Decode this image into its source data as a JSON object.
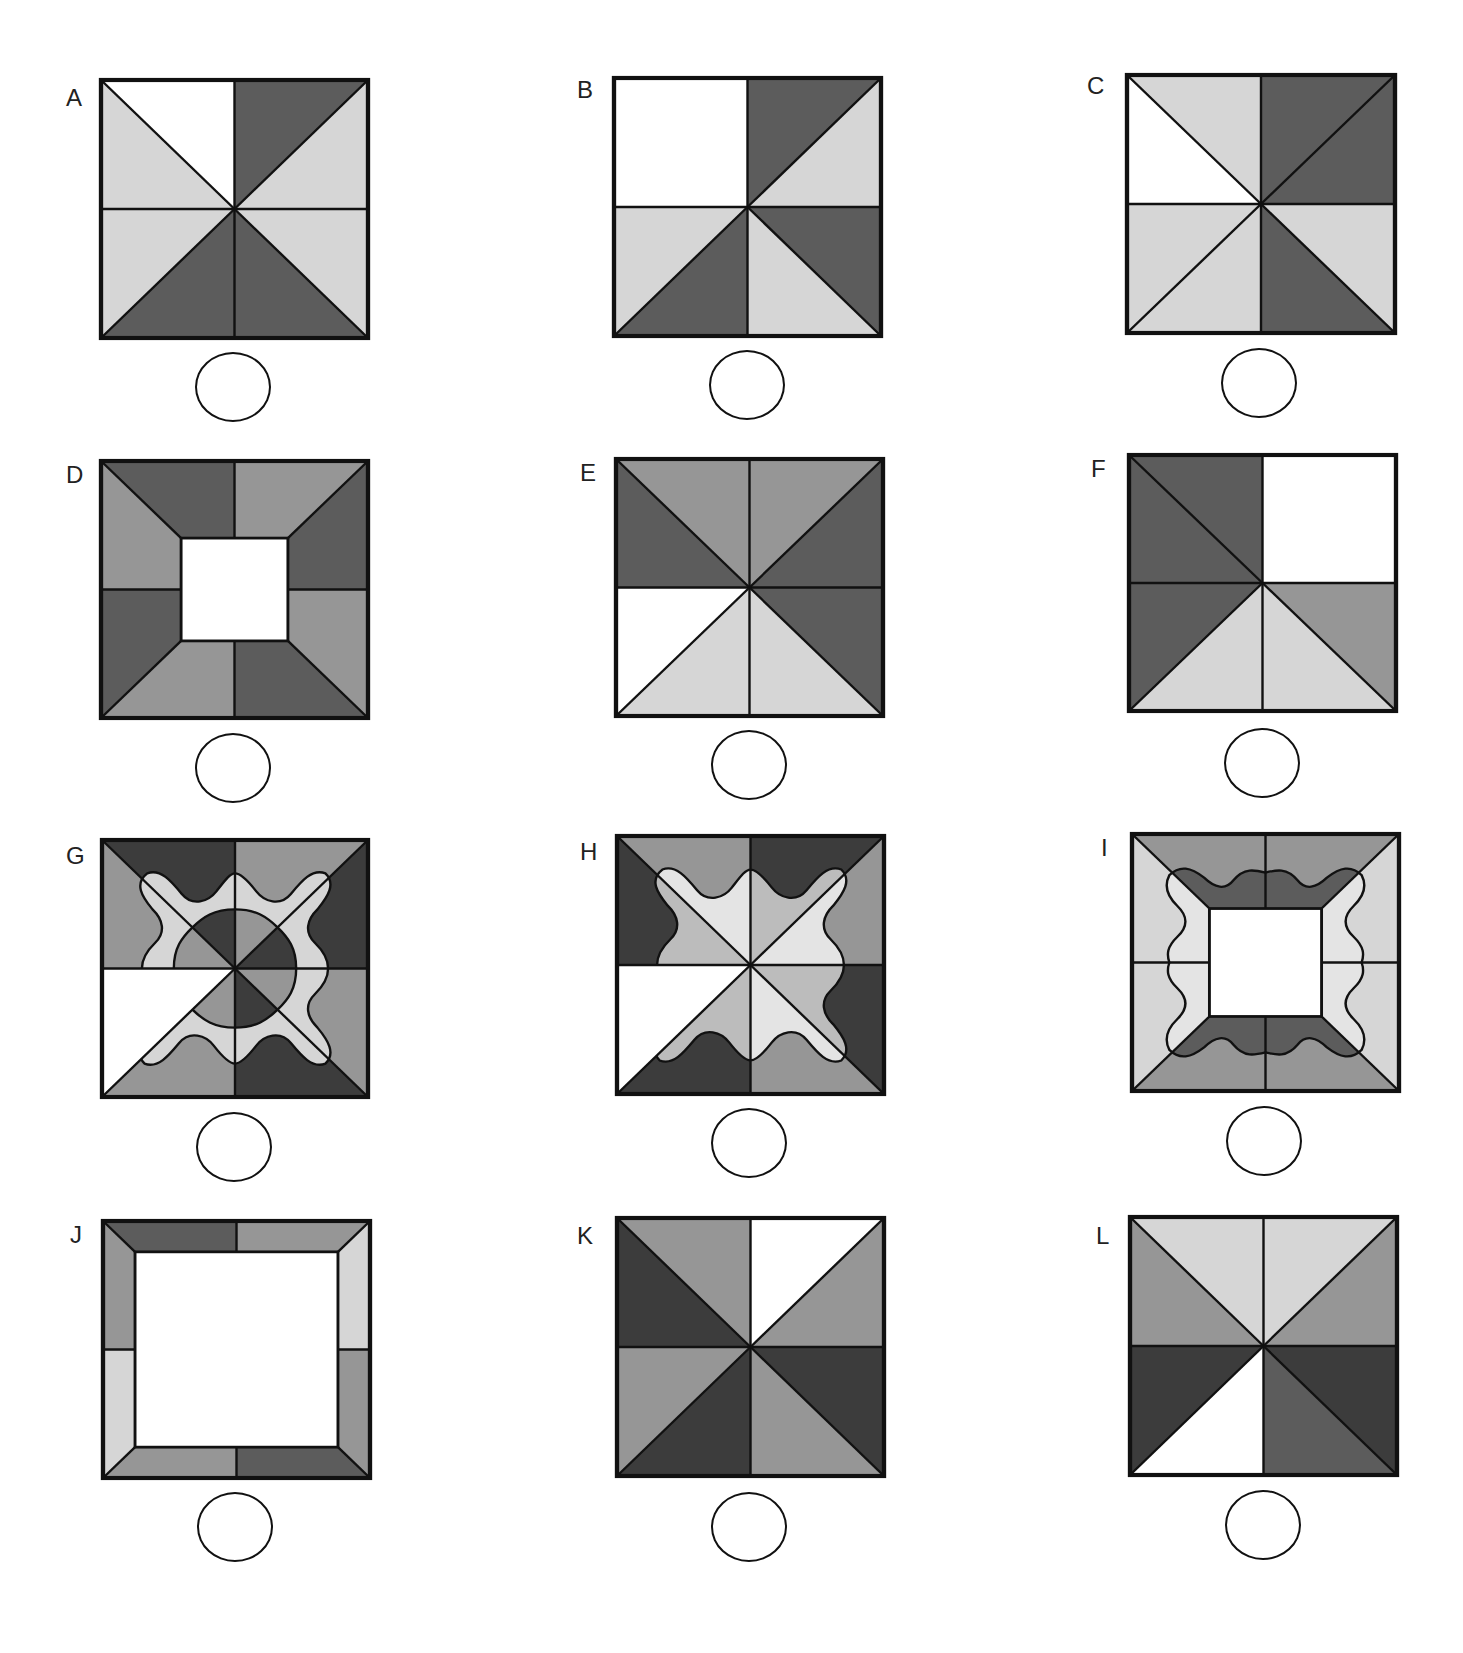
{
  "page": {
    "header_fragment": "",
    "colors": {
      "white": "#ffffff",
      "light": "#d6d6d6",
      "pale": "#e4e4e4",
      "midlight": "#bcbcbc",
      "medium": "#969696",
      "dark": "#5c5c5c",
      "darkest": "#3c3c3c",
      "stroke": "#111111"
    }
  },
  "items": [
    {
      "label": "A",
      "x": 101,
      "y": 80,
      "w": 267,
      "h": 258,
      "lx": 66,
      "ly": 84,
      "bx": 195,
      "by": 352,
      "type": "octants",
      "fill": {
        "T1": "white",
        "T2": "dark",
        "R1": "light",
        "R2": "light",
        "B2": "dark",
        "B1": "dark",
        "L2": "light",
        "L1": "light"
      }
    },
    {
      "label": "B",
      "x": 614,
      "y": 78,
      "w": 267,
      "h": 258,
      "lx": 577,
      "ly": 76,
      "bx": 709,
      "by": 350,
      "type": "octants",
      "merge": [
        "TL"
      ],
      "fill": {
        "T1": "white",
        "L1": "white",
        "T2": "dark",
        "R1": "light",
        "R2": "dark",
        "B2": "light",
        "B1": "dark",
        "L2": "light"
      }
    },
    {
      "label": "C",
      "x": 1127,
      "y": 75,
      "w": 268,
      "h": 258,
      "lx": 1087,
      "ly": 72,
      "bx": 1221,
      "by": 348,
      "type": "octants",
      "fill": {
        "T1": "light",
        "L1": "white",
        "T2": "dark",
        "R1": "dark",
        "R2": "light",
        "B2": "dark",
        "B1": "light",
        "L2": "light"
      }
    },
    {
      "label": "D",
      "x": 101,
      "y": 461,
      "w": 267,
      "h": 257,
      "lx": 66,
      "ly": 461,
      "bx": 195,
      "by": 733,
      "type": "frame",
      "inset": 30,
      "fill": {
        "T1": "dark",
        "T2": "medium",
        "R1": "dark",
        "R2": "medium",
        "B2": "dark",
        "B1": "medium",
        "L2": "dark",
        "L1": "medium"
      }
    },
    {
      "label": "E",
      "x": 616,
      "y": 459,
      "w": 267,
      "h": 257,
      "lx": 580,
      "ly": 459,
      "bx": 711,
      "by": 730,
      "type": "octants",
      "fill": {
        "T1": "medium",
        "T2": "medium",
        "R1": "dark",
        "R2": "dark",
        "B2": "light",
        "B1": "light",
        "L2": "white",
        "L1": "dark"
      }
    },
    {
      "label": "F",
      "x": 1129,
      "y": 455,
      "w": 267,
      "h": 256,
      "lx": 1091,
      "ly": 455,
      "bx": 1224,
      "by": 728,
      "type": "octants",
      "merge": [
        "TR"
      ],
      "fill": {
        "T1": "dark",
        "L1": "dark",
        "T2": "white",
        "R1": "white",
        "R2": "medium",
        "B2": "light",
        "B1": "light",
        "L2": "dark"
      }
    },
    {
      "label": "G",
      "x": 102,
      "y": 840,
      "w": 266,
      "h": 257,
      "lx": 66,
      "ly": 842,
      "bx": 196,
      "by": 1112,
      "type": "wavy",
      "fill": {
        "T1": "darkest",
        "T2": "medium",
        "R1": "darkest",
        "R2": "medium",
        "B2": "darkest",
        "B1": "medium",
        "L2": "white",
        "L1": "medium"
      },
      "band": "light",
      "inner": {
        "T1": "darkest",
        "T2": "medium",
        "R1": "darkest",
        "R2": "medium",
        "B2": "darkest",
        "B1": "medium",
        "L1": "medium"
      }
    },
    {
      "label": "H",
      "x": 617,
      "y": 836,
      "w": 267,
      "h": 258,
      "lx": 580,
      "ly": 838,
      "bx": 711,
      "by": 1108,
      "type": "wavy",
      "fill": {
        "T1": "medium",
        "T2": "darkest",
        "R1": "medium",
        "R2": "darkest",
        "B2": "medium",
        "B1": "darkest",
        "L2": "white",
        "L1": "darkest"
      },
      "band": null,
      "inner": {
        "T1": "pale",
        "T2": "midlight",
        "R1": "pale",
        "R2": "midlight",
        "B2": "pale",
        "B1": "midlight",
        "L1": "midlight"
      }
    },
    {
      "label": "I",
      "x": 1132,
      "y": 834,
      "w": 267,
      "h": 257,
      "lx": 1101,
      "ly": 834,
      "bx": 1226,
      "by": 1106,
      "type": "wavyframe",
      "inset": 29,
      "fill": {
        "T1": "medium",
        "T2": "medium",
        "R1": "light",
        "R2": "light",
        "B2": "medium",
        "B1": "medium",
        "L2": "light",
        "L1": "light"
      },
      "inner": {
        "T1": "dark",
        "T2": "dark",
        "R1": "pale",
        "R2": "pale",
        "B2": "dark",
        "B1": "dark",
        "L2": "pale",
        "L1": "pale"
      }
    },
    {
      "label": "J",
      "x": 103,
      "y": 1221,
      "w": 267,
      "h": 257,
      "lx": 70,
      "ly": 1221,
      "bx": 197,
      "by": 1492,
      "type": "frame",
      "inset": 12,
      "fill": {
        "T1": "dark",
        "T2": "medium",
        "R1": "light",
        "R2": "medium",
        "B2": "dark",
        "B1": "medium",
        "L2": "light",
        "L1": "medium"
      }
    },
    {
      "label": "K",
      "x": 617,
      "y": 1218,
      "w": 267,
      "h": 258,
      "lx": 577,
      "ly": 1222,
      "bx": 711,
      "by": 1492,
      "type": "octants",
      "fill": {
        "T1": "medium",
        "T2": "white",
        "R1": "medium",
        "R2": "darkest",
        "B2": "medium",
        "B1": "darkest",
        "L2": "medium",
        "L1": "darkest"
      }
    },
    {
      "label": "L",
      "x": 1130,
      "y": 1217,
      "w": 267,
      "h": 258,
      "lx": 1096,
      "ly": 1222,
      "bx": 1225,
      "by": 1490,
      "type": "octants",
      "fill": {
        "T1": "light",
        "T2": "light",
        "R1": "medium",
        "R2": "darkest",
        "B2": "dark",
        "B1": "white",
        "L2": "darkest",
        "L1": "medium"
      }
    }
  ]
}
